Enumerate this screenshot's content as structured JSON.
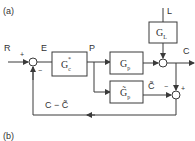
{
  "panels": [
    {
      "label": "(a)"
    },
    {
      "label": "(b)"
    }
  ],
  "signals": {
    "reference": "R",
    "error": "E",
    "controller_output": "P",
    "output": "C",
    "load": "L",
    "model_output": "C̃",
    "feedback": "C − C̃"
  },
  "blocks": {
    "controller": {
      "main": "G",
      "sub": "c",
      "sup": "*"
    },
    "process": {
      "main": "G",
      "sub": "p"
    },
    "load": {
      "main": "G",
      "sub": "L"
    },
    "model": {
      "main": "G̃",
      "sub": "p"
    }
  },
  "signs": {
    "sum1_top": "+",
    "sum1_bottom": "−",
    "sum3_left": "−",
    "sum3_top": "+"
  },
  "colors": {
    "line": "#3a3a3a",
    "text": "#333333",
    "background": "#ffffff"
  }
}
